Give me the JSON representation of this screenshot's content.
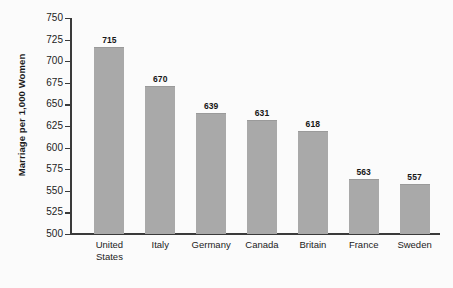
{
  "chart_data": {
    "type": "bar",
    "title": "",
    "subtitle": "",
    "xlabel": "",
    "ylabel": "Marriage per 1,000 Women",
    "categories": [
      "United\nStates",
      "Italy",
      "Germany",
      "Canada",
      "Britain",
      "France",
      "Sweden"
    ],
    "values": [
      715,
      670,
      639,
      631,
      618,
      563,
      557
    ],
    "value_labels": [
      "715",
      "670",
      "639",
      "631",
      "618",
      "563",
      "557"
    ],
    "ylim": [
      500,
      750
    ],
    "ytick_step": 25,
    "ytick_labels": [
      "750",
      "725",
      "700",
      "675",
      "650",
      "625",
      "600",
      "575",
      "550",
      "525",
      "500"
    ],
    "ytick_values": [
      750,
      725,
      700,
      675,
      650,
      625,
      600,
      575,
      550,
      525,
      500
    ],
    "grid": false,
    "legend": false,
    "legend_position": "none",
    "bar_color": "#a9a9a9",
    "axis_color": "#3a3a3a",
    "text_color": "#1b1b1b",
    "background_color": "#fbfbfb"
  }
}
